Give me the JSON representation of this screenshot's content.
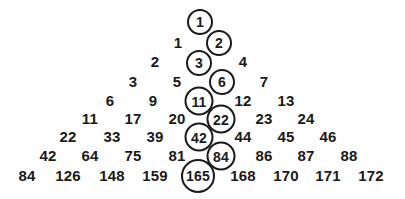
{
  "figure": {
    "type": "number-triangle",
    "background_color": "#ffffff",
    "text_color": "#1a1a1a",
    "circle_stroke_color": "#1a1a1a",
    "width": 405,
    "height": 199,
    "row_count": 9
  },
  "chart_data": {
    "type": "table",
    "title": "",
    "xlabel": "",
    "ylabel": "",
    "rows": [
      {
        "index": 1,
        "values": [
          1
        ]
      },
      {
        "index": 2,
        "values": [
          1,
          2
        ]
      },
      {
        "index": 3,
        "values": [
          2,
          3,
          4
        ]
      },
      {
        "index": 4,
        "values": [
          3,
          5,
          6,
          7
        ]
      },
      {
        "index": 5,
        "values": [
          6,
          9,
          11,
          12,
          13
        ]
      },
      {
        "index": 6,
        "values": [
          11,
          17,
          20,
          22,
          23,
          24
        ]
      },
      {
        "index": 7,
        "values": [
          22,
          33,
          39,
          42,
          44,
          45,
          46
        ]
      },
      {
        "index": 8,
        "values": [
          42,
          64,
          75,
          81,
          84,
          86,
          87,
          88
        ]
      },
      {
        "index": 9,
        "values": [
          84,
          126,
          148,
          159,
          165,
          168,
          170,
          171,
          172
        ]
      }
    ],
    "highlighted_values": [
      1,
      2,
      3,
      6,
      11,
      22,
      42,
      84,
      165
    ]
  },
  "cells": [
    {
      "id": "c-r1-1",
      "label": "1",
      "x": 200,
      "y": 22,
      "circled": true,
      "digits": 1
    },
    {
      "id": "c-r2-1",
      "label": "1",
      "x": 178,
      "y": 42,
      "circled": false,
      "digits": 1
    },
    {
      "id": "c-r2-2",
      "label": "2",
      "x": 219,
      "y": 43,
      "circled": true,
      "digits": 1
    },
    {
      "id": "c-r3-1",
      "label": "2",
      "x": 155,
      "y": 61,
      "circled": false,
      "digits": 1
    },
    {
      "id": "c-r3-2",
      "label": "3",
      "x": 199,
      "y": 63,
      "circled": true,
      "digits": 1
    },
    {
      "id": "c-r3-3",
      "label": "4",
      "x": 243,
      "y": 61,
      "circled": false,
      "digits": 1
    },
    {
      "id": "c-r4-1",
      "label": "3",
      "x": 133,
      "y": 81,
      "circled": false,
      "digits": 1
    },
    {
      "id": "c-r4-2",
      "label": "5",
      "x": 177,
      "y": 81,
      "circled": false,
      "digits": 1
    },
    {
      "id": "c-r4-3",
      "label": "6",
      "x": 222,
      "y": 82,
      "circled": true,
      "digits": 1
    },
    {
      "id": "c-r4-4",
      "label": "7",
      "x": 264,
      "y": 81,
      "circled": false,
      "digits": 1
    },
    {
      "id": "c-r5-1",
      "label": "6",
      "x": 110,
      "y": 100,
      "circled": false,
      "digits": 1
    },
    {
      "id": "c-r5-2",
      "label": "9",
      "x": 153,
      "y": 100,
      "circled": false,
      "digits": 1
    },
    {
      "id": "c-r5-3",
      "label": "11",
      "x": 199,
      "y": 101,
      "circled": true,
      "digits": 2
    },
    {
      "id": "c-r5-4",
      "label": "12",
      "x": 243,
      "y": 100,
      "circled": false,
      "digits": 2
    },
    {
      "id": "c-r5-5",
      "label": "13",
      "x": 286,
      "y": 100,
      "circled": false,
      "digits": 2
    },
    {
      "id": "c-r6-1",
      "label": "11",
      "x": 90,
      "y": 118,
      "circled": false,
      "digits": 2
    },
    {
      "id": "c-r6-2",
      "label": "17",
      "x": 133,
      "y": 118,
      "circled": false,
      "digits": 2
    },
    {
      "id": "c-r6-3",
      "label": "20",
      "x": 177,
      "y": 118,
      "circled": false,
      "digits": 2
    },
    {
      "id": "c-r6-4",
      "label": "22",
      "x": 221,
      "y": 119,
      "circled": true,
      "digits": 2
    },
    {
      "id": "c-r6-5",
      "label": "23",
      "x": 264,
      "y": 118,
      "circled": false,
      "digits": 2
    },
    {
      "id": "c-r6-6",
      "label": "24",
      "x": 306,
      "y": 118,
      "circled": false,
      "digits": 2
    },
    {
      "id": "c-r7-1",
      "label": "22",
      "x": 68,
      "y": 136,
      "circled": false,
      "digits": 2
    },
    {
      "id": "c-r7-2",
      "label": "33",
      "x": 112,
      "y": 136,
      "circled": false,
      "digits": 2
    },
    {
      "id": "c-r7-3",
      "label": "39",
      "x": 155,
      "y": 136,
      "circled": false,
      "digits": 2
    },
    {
      "id": "c-r7-4",
      "label": "42",
      "x": 199,
      "y": 137,
      "circled": true,
      "digits": 2
    },
    {
      "id": "c-r7-5",
      "label": "44",
      "x": 243,
      "y": 136,
      "circled": false,
      "digits": 2
    },
    {
      "id": "c-r7-6",
      "label": "45",
      "x": 286,
      "y": 136,
      "circled": false,
      "digits": 2
    },
    {
      "id": "c-r7-7",
      "label": "46",
      "x": 328,
      "y": 136,
      "circled": false,
      "digits": 2
    },
    {
      "id": "c-r8-1",
      "label": "42",
      "x": 48,
      "y": 155,
      "circled": false,
      "digits": 2
    },
    {
      "id": "c-r8-2",
      "label": "64",
      "x": 90,
      "y": 155,
      "circled": false,
      "digits": 2
    },
    {
      "id": "c-r8-3",
      "label": "75",
      "x": 133,
      "y": 155,
      "circled": false,
      "digits": 2
    },
    {
      "id": "c-r8-4",
      "label": "81",
      "x": 177,
      "y": 155,
      "circled": false,
      "digits": 2
    },
    {
      "id": "c-r8-5",
      "label": "84",
      "x": 221,
      "y": 156,
      "circled": true,
      "digits": 2
    },
    {
      "id": "c-r8-6",
      "label": "86",
      "x": 264,
      "y": 155,
      "circled": false,
      "digits": 2
    },
    {
      "id": "c-r8-7",
      "label": "87",
      "x": 306,
      "y": 155,
      "circled": false,
      "digits": 2
    },
    {
      "id": "c-r8-8",
      "label": "88",
      "x": 349,
      "y": 155,
      "circled": false,
      "digits": 2
    },
    {
      "id": "c-r9-1",
      "label": "84",
      "x": 27,
      "y": 175,
      "circled": false,
      "digits": 2
    },
    {
      "id": "c-r9-2",
      "label": "126",
      "x": 68,
      "y": 175,
      "circled": false,
      "digits": 3
    },
    {
      "id": "c-r9-3",
      "label": "148",
      "x": 112,
      "y": 175,
      "circled": false,
      "digits": 3
    },
    {
      "id": "c-r9-4",
      "label": "159",
      "x": 155,
      "y": 175,
      "circled": false,
      "digits": 3
    },
    {
      "id": "c-r9-5",
      "label": "165",
      "x": 198,
      "y": 176,
      "circled": true,
      "digits": 3
    },
    {
      "id": "c-r9-6",
      "label": "168",
      "x": 243,
      "y": 175,
      "circled": false,
      "digits": 3
    },
    {
      "id": "c-r9-7",
      "label": "170",
      "x": 286,
      "y": 175,
      "circled": false,
      "digits": 3
    },
    {
      "id": "c-r9-8",
      "label": "171",
      "x": 328,
      "y": 175,
      "circled": false,
      "digits": 3
    },
    {
      "id": "c-r9-9",
      "label": "172",
      "x": 371,
      "y": 175,
      "circled": false,
      "digits": 3
    }
  ]
}
